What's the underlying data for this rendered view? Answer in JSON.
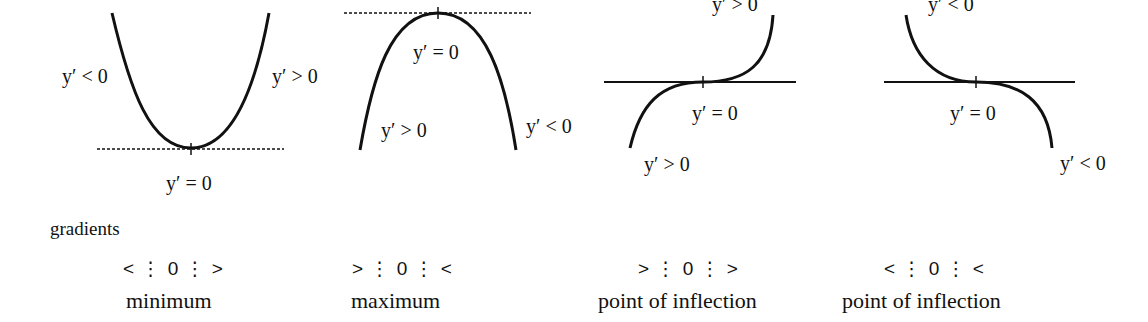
{
  "diagrams": [
    {
      "id": "minimum",
      "labels": {
        "left": "y′ < 0",
        "right": "y′ > 0",
        "bottom": "y′ = 0"
      },
      "gradient_pattern": "< ⋮ 0 ⋮ >",
      "name": "minimum"
    },
    {
      "id": "maximum",
      "labels": {
        "top": "y′ = 0",
        "left": "y′ > 0",
        "right": "y′ < 0"
      },
      "gradient_pattern": "> ⋮ 0 ⋮ <",
      "name": "maximum"
    },
    {
      "id": "inflection-rising",
      "labels": {
        "top": "y′ > 0",
        "middle": "y′ = 0",
        "bottom": "y′ > 0"
      },
      "gradient_pattern": "> ⋮ 0 ⋮ >",
      "name": "point of inflection"
    },
    {
      "id": "inflection-falling",
      "labels": {
        "top": "y′ < 0",
        "middle": "y′ = 0",
        "bottom": "y′ < 0"
      },
      "gradient_pattern": "< ⋮ 0 ⋮ <",
      "name": "point of inflection"
    }
  ],
  "gradients_title": "gradients",
  "colors": {
    "ink": "#111111",
    "background": "#ffffff"
  }
}
